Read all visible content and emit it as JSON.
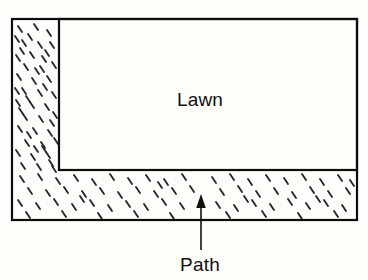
{
  "figure": {
    "background_color": "#fdfdfa",
    "stroke_color": "#0d0d0d"
  },
  "regions": [
    {
      "id": "lawn",
      "label": "Lawn",
      "fill": "plain",
      "fill_color": "#fdfdfa",
      "label_x": 200,
      "label_y": 106
    },
    {
      "id": "path",
      "label": "Path",
      "fill": "stipple",
      "fill_color": "#fdfdfa",
      "label_x": 200,
      "label_y": 270
    }
  ],
  "shapes": {
    "outer_rect": {
      "x": 12,
      "y": 19,
      "width": 345,
      "height": 201,
      "stroke_width": 2.2
    },
    "lawn_rect": {
      "x": 59,
      "y": 19,
      "width": 298,
      "height": 151,
      "stroke_width": 2.2
    }
  },
  "annotations": [
    {
      "id": "path-callout",
      "text": "Path",
      "arrow_from_x": 201,
      "arrow_from_y": 250,
      "arrow_to_x": 201,
      "arrow_to_y": 195,
      "direction": "up"
    }
  ],
  "texture": {
    "name": "stipple-dash",
    "description": "scattered short tilted dashes",
    "color": "#2a2a2a"
  },
  "labels": {
    "lawn": "Lawn",
    "path": "Path"
  }
}
